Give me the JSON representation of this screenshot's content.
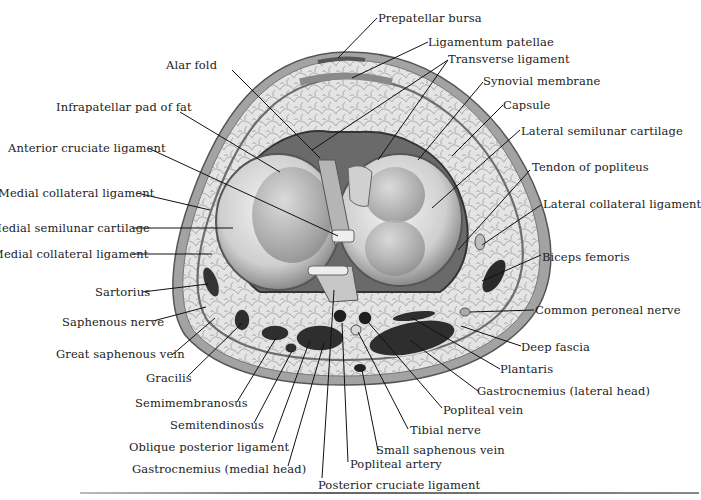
{
  "figure": {
    "colors": {
      "skin": "#9a9a9a",
      "fat": "#dcdcdc",
      "cartilage": "#e6e6e6",
      "muscle": "#2e2e2e",
      "leader": "#111111"
    }
  },
  "labels": {
    "prepatellar_bursa": "Prepatellar bursa",
    "ligamentum_patellae": "Ligamentum patellae",
    "transverse_ligament": "Transverse ligament",
    "alar_fold": "Alar fold",
    "synovial_membrane": "Synovial membrane",
    "infrapatellar_pad": "Infrapatellar pad of fat",
    "capsule": "Capsule",
    "anterior_cruciate": "Anterior cruciate ligament",
    "lateral_semilunar": "Lateral semilunar cartilage",
    "tendon_popliteus": "Tendon of popliteus",
    "medial_collateral_1": "Medial collateral ligament",
    "lateral_collateral": "Lateral collateral ligament",
    "medial_semilunar": "Medial semilunar cartilage",
    "medial_collateral_2": "Medial collateral ligament",
    "biceps_femoris": "Biceps femoris",
    "sartorius": "Sartorius",
    "common_peroneal": "Common peroneal nerve",
    "saphenous_nerve": "Saphenous nerve",
    "deep_fascia": "Deep fascia",
    "great_saphenous": "Great saphenous vein",
    "plantaris": "Plantaris",
    "gracilis": "Gracilis",
    "gastrocnemius_lateral": "Gastrocnemius (lateral head)",
    "semimembranosus": "Semimembranosus",
    "popliteal_vein": "Popliteal vein",
    "semitendinosus": "Semitendinosus",
    "tibial_nerve": "Tibial nerve",
    "oblique_posterior": "Oblique posterior ligament",
    "small_saphenous": "Small saphenous vein",
    "gastrocnemius_medial": "Gastrocnemius (medial head)",
    "popliteal_artery": "Popliteal artery",
    "posterior_cruciate": "Posterior cruciate ligament"
  }
}
